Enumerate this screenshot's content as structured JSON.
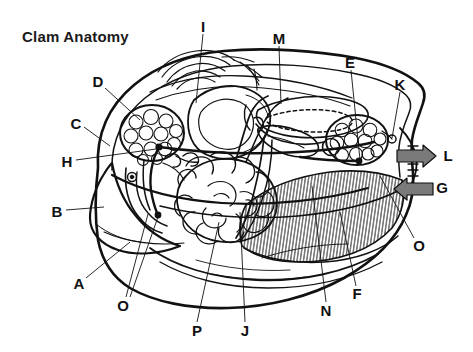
{
  "page": {
    "title": "Clam Anatomy",
    "width": 473,
    "height": 352,
    "background_color": "#ffffff",
    "ink_color": "#111111",
    "arrow_fill_color": "#7a7a7a"
  },
  "diagram": {
    "label_count": 16
  },
  "labels": [
    {
      "key": "title",
      "text": "Clam Anatomy",
      "x": 22,
      "y": 35
    },
    {
      "key": "A",
      "text": "A",
      "x": 79,
      "y": 283
    },
    {
      "key": "B",
      "text": "B",
      "x": 57,
      "y": 211
    },
    {
      "key": "C",
      "text": "C",
      "x": 76,
      "y": 123
    },
    {
      "key": "D",
      "text": "D",
      "x": 98,
      "y": 81
    },
    {
      "key": "E",
      "text": "E",
      "x": 350,
      "y": 62
    },
    {
      "key": "F",
      "text": "F",
      "x": 357,
      "y": 293
    },
    {
      "key": "G",
      "text": "G",
      "x": 442,
      "y": 187
    },
    {
      "key": "H",
      "text": "H",
      "x": 67,
      "y": 161
    },
    {
      "key": "I",
      "text": "I",
      "x": 203,
      "y": 26
    },
    {
      "key": "J",
      "text": "J",
      "x": 245,
      "y": 330
    },
    {
      "key": "K",
      "text": "K",
      "x": 400,
      "y": 84
    },
    {
      "key": "L",
      "text": "L",
      "x": 448,
      "y": 155
    },
    {
      "key": "M",
      "text": "M",
      "x": 279,
      "y": 38
    },
    {
      "key": "N",
      "text": "N",
      "x": 326,
      "y": 310
    },
    {
      "key": "O-left",
      "text": "O",
      "x": 123,
      "y": 305
    },
    {
      "key": "O-right",
      "text": "O",
      "x": 419,
      "y": 245
    },
    {
      "key": "P",
      "text": "P",
      "x": 197,
      "y": 330
    }
  ],
  "arrows": [
    {
      "key": "L",
      "direction": "right",
      "meaning": "excurrent-flow",
      "x": 400,
      "y": 157
    },
    {
      "key": "G",
      "direction": "left",
      "meaning": "incurrent-flow",
      "x": 400,
      "y": 189
    }
  ]
}
